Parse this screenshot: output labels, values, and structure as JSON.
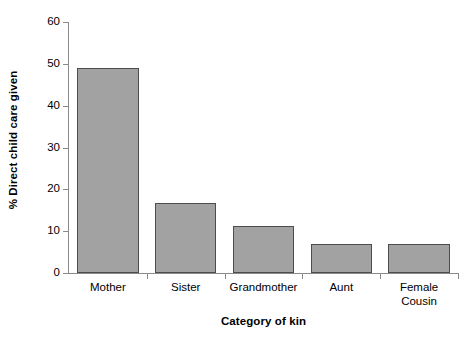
{
  "chart_data": {
    "type": "bar",
    "title": "",
    "subtitle": "",
    "xlabel": "Category of kin",
    "ylabel": "% Direct child care given",
    "categories": [
      "Mother",
      "Sister",
      "Grandmother",
      "Aunt",
      "Female\nCousin"
    ],
    "values": [
      48.9,
      16.7,
      11.3,
      6.9,
      7.0
    ],
    "ylim": [
      0,
      60
    ],
    "yticks": [
      0,
      10,
      20,
      30,
      40,
      50,
      60
    ],
    "ytick_labels": [
      "0",
      "10",
      "20",
      "30",
      "40",
      "50",
      "60"
    ],
    "grid": false,
    "legend": null,
    "legend_position": "none",
    "bar_fill_color": "#a2a2a2",
    "bar_edge_color": "#4d4d4d",
    "axis_color": "#8a8a8a",
    "background_color": "#ffffff"
  },
  "axis": {
    "y_title": "% Direct child care given",
    "x_title": "Category of kin"
  }
}
